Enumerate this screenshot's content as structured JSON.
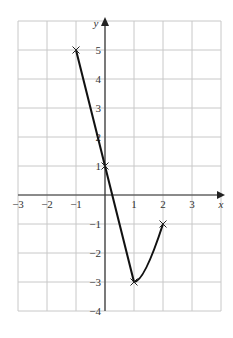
{
  "chart_data": {
    "type": "line",
    "title": "",
    "xlabel": "x",
    "ylabel": "y",
    "xlim": [
      -3,
      4
    ],
    "ylim": [
      -4,
      6
    ],
    "grid": true,
    "x_ticks": [
      -3,
      -2,
      -1,
      1,
      2,
      3
    ],
    "y_ticks": [
      -4,
      -3,
      -2,
      -1,
      1,
      2,
      3,
      4,
      5
    ],
    "series": [
      {
        "name": "graph",
        "segments": [
          {
            "kind": "straight",
            "points": [
              [
                -1,
                5
              ],
              [
                0,
                1
              ],
              [
                1,
                -3
              ]
            ]
          },
          {
            "kind": "curve",
            "points": [
              [
                1,
                -3
              ],
              [
                2,
                -1
              ]
            ]
          }
        ],
        "marked_points": [
          [
            -1,
            5
          ],
          [
            0,
            1
          ],
          [
            1,
            -3
          ],
          [
            2,
            -1
          ]
        ]
      }
    ]
  }
}
